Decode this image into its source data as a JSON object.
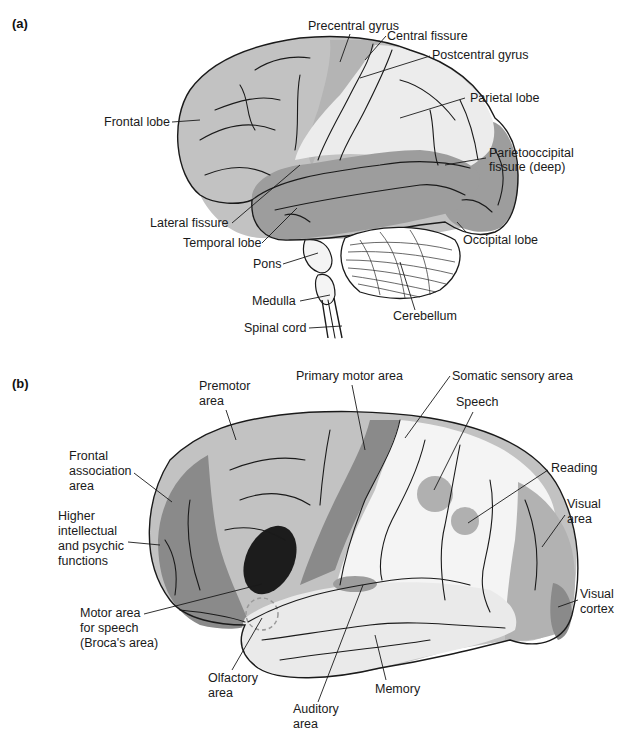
{
  "panels": [
    {
      "id": "a",
      "tag": "(a)",
      "title": "Lateral view of brain: lobes and fissures",
      "labels": {
        "precentral_gyrus": "Precentral gyrus",
        "central_fissure": "Central fissure",
        "postcentral_gyrus": "Postcentral gyrus",
        "parietal_lobe": "Parietal lobe",
        "frontal_lobe": "Frontal lobe",
        "parietooccipital_1": "Parietooccipital",
        "parietooccipital_2": "fissure (deep)",
        "lateral_fissure": "Lateral fissure",
        "temporal_lobe": "Temporal lobe",
        "occipital_lobe": "Occipital lobe",
        "pons": "Pons",
        "medulla": "Medulla",
        "spinal_cord": "Spinal cord",
        "cerebellum": "Cerebellum"
      }
    },
    {
      "id": "b",
      "tag": "(b)",
      "title": "Functional areas of cerebral cortex",
      "labels": {
        "premotor_1": "Premotor",
        "premotor_2": "area",
        "primary_motor": "Primary motor area",
        "somatic_sensory": "Somatic sensory area",
        "speech": "Speech",
        "reading": "Reading",
        "frontal_assoc_1": "Frontal",
        "frontal_assoc_2": "association",
        "frontal_assoc_3": "area",
        "higher_1": "Higher",
        "higher_2": "intellectual",
        "higher_3": "and psychic",
        "higher_4": "functions",
        "visual_area_1": "Visual",
        "visual_area_2": "area",
        "visual_cortex_1": "Visual",
        "visual_cortex_2": "cortex",
        "broca_1": "Motor area",
        "broca_2": "for speech",
        "broca_3": "(Broca's area)",
        "olfactory_1": "Olfactory",
        "olfactory_2": "area",
        "memory": "Memory",
        "auditory_1": "Auditory",
        "auditory_2": "area"
      }
    }
  ],
  "colors": {
    "background": "#ffffff",
    "light_gray": "#c2c2c2",
    "mid_gray": "#9d9d9d",
    "dark_gray": "#8a8a8a",
    "very_light": "#ececec",
    "white_region": "#f4f4f4",
    "broca_black": "#1c1c1c",
    "outline": "#1a1a1a"
  }
}
